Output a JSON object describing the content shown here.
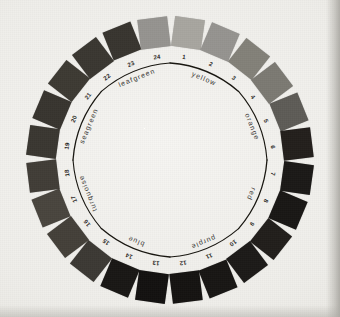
{
  "figure": {
    "name": "color-wheel-chart",
    "center_x": 170,
    "center_y": 160,
    "swatch_radius": 128,
    "number_radius": 104,
    "hue_label_radius": 88,
    "arc_radius": 97,
    "swatch_size": 30,
    "paper_color": "#efeeea",
    "ink_color": "#17150f"
  },
  "chart_data": {
    "type": "pie",
    "xlabel": "",
    "ylabel": "",
    "legend_position": "inner-ring",
    "grid": false,
    "categories": [
      "1",
      "2",
      "3",
      "4",
      "5",
      "6",
      "7",
      "8",
      "9",
      "10",
      "11",
      "12",
      "13",
      "14",
      "15",
      "16",
      "17",
      "18",
      "19",
      "20",
      "21",
      "22",
      "23",
      "24"
    ],
    "values": [
      15,
      15,
      15,
      15,
      15,
      15,
      15,
      15,
      15,
      15,
      15,
      15,
      15,
      15,
      15,
      15,
      15,
      15,
      15,
      15,
      15,
      15,
      15,
      15
    ],
    "series": [
      {
        "name": "swatch-gray-value",
        "values": [
          168,
          150,
          131,
          124,
          96,
          38,
          30,
          28,
          34,
          30,
          28,
          24,
          22,
          28,
          62,
          70,
          74,
          66,
          58,
          56,
          62,
          58,
          56,
          150
        ]
      }
    ],
    "angles_deg": [
      -75,
      -60,
      -45,
      -30,
      -15,
      0,
      15,
      30,
      45,
      60,
      75,
      90,
      105,
      120,
      135,
      150,
      165,
      180,
      195,
      210,
      225,
      240,
      255,
      -90
    ],
    "swatches": [
      {
        "number": "1",
        "angle": -82,
        "color": "#a8a6a0",
        "hue_family": "yellow"
      },
      {
        "number": "2",
        "angle": -67,
        "color": "#969490",
        "hue_family": "yellow"
      },
      {
        "number": "3",
        "angle": -52,
        "color": "#838179",
        "hue_family": "yellow"
      },
      {
        "number": "4",
        "angle": -37,
        "color": "#7c7a73",
        "hue_family": "orange"
      },
      {
        "number": "5",
        "angle": -22,
        "color": "#5e5c57",
        "hue_family": "orange"
      },
      {
        "number": "6",
        "angle": -7,
        "color": "#231f1c",
        "hue_family": "orange"
      },
      {
        "number": "7",
        "angle": 8,
        "color": "#1b1917",
        "hue_family": "red"
      },
      {
        "number": "8",
        "angle": 23,
        "color": "#191715",
        "hue_family": "red"
      },
      {
        "number": "9",
        "angle": 38,
        "color": "#211e1b",
        "hue_family": "red"
      },
      {
        "number": "10",
        "angle": 53,
        "color": "#1c1a18",
        "hue_family": "purple"
      },
      {
        "number": "11",
        "angle": 68,
        "color": "#181614",
        "hue_family": "purple"
      },
      {
        "number": "12",
        "angle": 83,
        "color": "#151311",
        "hue_family": "purple"
      },
      {
        "number": "13",
        "angle": 98,
        "color": "#131110",
        "hue_family": "blue"
      },
      {
        "number": "14",
        "angle": 113,
        "color": "#191715",
        "hue_family": "blue"
      },
      {
        "number": "15",
        "angle": 128,
        "color": "#3c3934",
        "hue_family": "blue"
      },
      {
        "number": "16",
        "angle": 143,
        "color": "#444039",
        "hue_family": "turquoise"
      },
      {
        "number": "17",
        "angle": 158,
        "color": "#49453e",
        "hue_family": "turquoise"
      },
      {
        "number": "18",
        "angle": 173,
        "color": "#413d37",
        "hue_family": "turquoise"
      },
      {
        "number": "19",
        "angle": 188,
        "color": "#3a3731",
        "hue_family": "seagreen"
      },
      {
        "number": "20",
        "angle": 203,
        "color": "#38352f",
        "hue_family": "seagreen"
      },
      {
        "number": "21",
        "angle": 218,
        "color": "#3d3a33",
        "hue_family": "seagreen"
      },
      {
        "number": "22",
        "angle": 233,
        "color": "#3a3731",
        "hue_family": "leafgreen"
      },
      {
        "number": "23",
        "angle": 248,
        "color": "#38352f",
        "hue_family": "leafgreen"
      },
      {
        "number": "24",
        "angle": 263,
        "color": "#969490",
        "hue_family": "leafgreen"
      }
    ],
    "hue_labels": [
      {
        "label": "yellow",
        "angle": -67,
        "rotation": 23
      },
      {
        "label": "orange",
        "angle": -22,
        "rotation": 68
      },
      {
        "label": "red",
        "angle": 23,
        "rotation": 113
      },
      {
        "label": "purple",
        "angle": 68,
        "rotation": 158
      },
      {
        "label": "blue",
        "angle": 113,
        "rotation": 203
      },
      {
        "label": "turquoise",
        "angle": 158,
        "rotation": 248
      },
      {
        "label": "seagreen",
        "angle": 203,
        "rotation": 293
      },
      {
        "label": "leafgreen",
        "angle": 248,
        "rotation": 338
      }
    ],
    "divider_angles": [
      -90,
      -45,
      0,
      45,
      90,
      135,
      180,
      225
    ]
  }
}
